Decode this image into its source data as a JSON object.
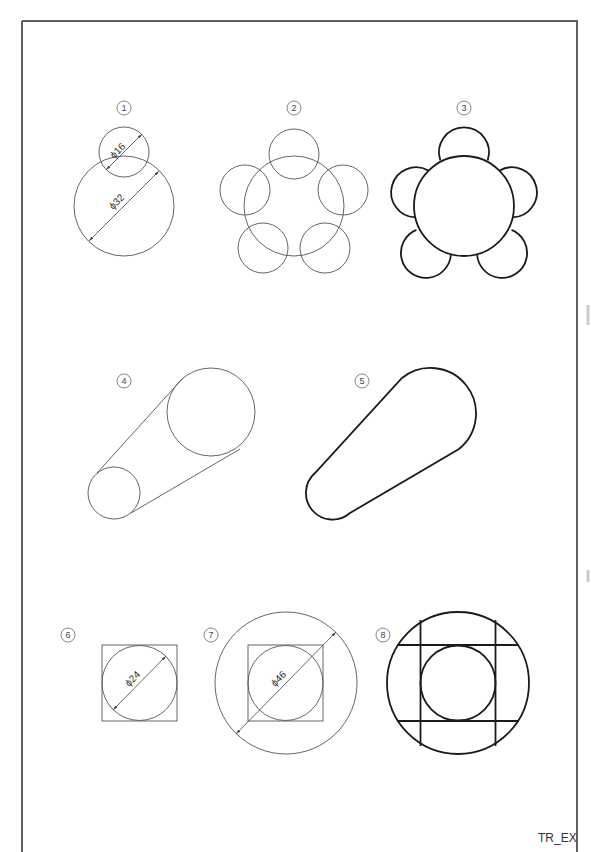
{
  "sheet": {
    "footer_label": "TR_EX",
    "border_color": "#606060",
    "line_color": "#555555",
    "bold_line_color": "#1a1a1a"
  },
  "figures": [
    {
      "id": 1,
      "label": "1",
      "description": "Two overlapping circles with diameter dimensions",
      "dimensions": [
        "ϕ16",
        "ϕ32"
      ]
    },
    {
      "id": 2,
      "label": "2",
      "description": "Central circle with five surrounding circles (construction)"
    },
    {
      "id": 3,
      "label": "3",
      "description": "Flower shape: central circle with five outer arcs (bold, trimmed)"
    },
    {
      "id": 4,
      "label": "4",
      "description": "Two circles connected by tangent lines (construction)"
    },
    {
      "id": 5,
      "label": "5",
      "description": "Slot/cam outline formed by tangent lines and arcs (bold, trimmed)"
    },
    {
      "id": 6,
      "label": "6",
      "description": "Circle inscribed in a square with diameter dimension",
      "dimensions": [
        "ϕ24"
      ]
    },
    {
      "id": 7,
      "label": "7",
      "description": "Circle in square inside a larger circle with diameter dimension",
      "dimensions": [
        "ϕ46"
      ]
    },
    {
      "id": 8,
      "label": "8",
      "description": "Inner circle, grid lines and outer circle (bold)"
    }
  ],
  "dimensions": {
    "d16": "ϕ16",
    "d32": "ϕ32",
    "d24": "ϕ24",
    "d46": "ϕ46"
  }
}
